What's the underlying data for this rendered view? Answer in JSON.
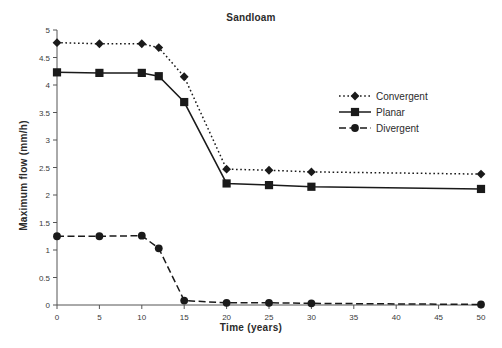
{
  "chart_data": {
    "type": "line",
    "title": "Sandloam",
    "xlabel": "Time (years)",
    "ylabel": "Maximum flow (mm/h)",
    "x": [
      0,
      5,
      10,
      12,
      15,
      20,
      25,
      30,
      50
    ],
    "xlim": [
      0,
      50
    ],
    "ylim": [
      0,
      5
    ],
    "xticks": [
      0,
      5,
      10,
      15,
      20,
      25,
      30,
      35,
      40,
      45,
      50
    ],
    "xtick_labels": [
      "0",
      "5",
      "10",
      "15",
      "20",
      "25",
      "30",
      "35",
      "40",
      "45",
      "50"
    ],
    "yticks": [
      0,
      0.5,
      1,
      1.5,
      2,
      2.5,
      3,
      3.5,
      4,
      4.5,
      5
    ],
    "ytick_labels": [
      "0",
      "0.5",
      "1",
      "1.5",
      "2",
      "2.5",
      "3",
      "3.5",
      "4",
      "4.5",
      "5"
    ],
    "grid": false,
    "legend_position": "right-middle",
    "series": [
      {
        "name": "Convergent",
        "values": [
          4.77,
          4.75,
          4.75,
          4.68,
          4.15,
          2.47,
          2.45,
          2.42,
          2.38
        ],
        "line_style": "dotted",
        "marker": "diamond",
        "color": "#1a1a1a"
      },
      {
        "name": "Planar",
        "values": [
          4.23,
          4.22,
          4.22,
          4.16,
          3.69,
          2.21,
          2.18,
          2.15,
          2.11
        ],
        "line_style": "solid",
        "marker": "square",
        "color": "#1a1a1a"
      },
      {
        "name": "Divergent",
        "values": [
          1.25,
          1.25,
          1.26,
          1.03,
          0.08,
          0.04,
          0.04,
          0.03,
          0.01
        ],
        "line_style": "dashed",
        "marker": "circle",
        "color": "#1a1a1a"
      }
    ]
  },
  "legend": {
    "items": [
      {
        "label": "Convergent"
      },
      {
        "label": "Planar"
      },
      {
        "label": "Divergent"
      }
    ]
  }
}
